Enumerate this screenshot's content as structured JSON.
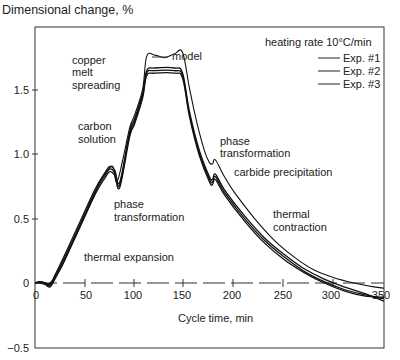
{
  "chart_data": {
    "type": "line",
    "title": "Dimensional change, %",
    "ylabel": "Dimensional change, %",
    "xlabel": "Cycle time, min",
    "xlim": [
      0,
      350
    ],
    "ylim": [
      -0.5,
      1.9
    ],
    "xticks": [
      0,
      50,
      100,
      150,
      200,
      250,
      300,
      350
    ],
    "yticks": [
      -0.5,
      0,
      0.5,
      1.0,
      1.5
    ],
    "xtick_labels": [
      "0",
      "50",
      "100",
      "150",
      "200",
      "250",
      "300",
      "350"
    ],
    "ytick_labels": [
      "−0.5",
      "0",
      "0.5",
      "1.0",
      "1.5"
    ],
    "grid": false,
    "zero_line": "dashed",
    "legend": {
      "title": "heating rate 10°C/min",
      "position": "upper right",
      "entries": [
        "Exp. #1",
        "Exp. #2",
        "Exp. #3"
      ]
    },
    "series": [
      {
        "name": "model",
        "x": [
          0,
          10,
          15,
          25,
          40,
          55,
          65,
          72,
          78,
          82,
          88,
          95,
          100,
          108,
          112,
          120,
          130,
          140,
          148,
          155,
          162,
          170,
          175,
          178,
          181,
          190,
          200,
          220,
          240,
          260,
          280,
          300,
          320,
          340,
          350
        ],
        "y": [
          0,
          0,
          0,
          0.1,
          0.35,
          0.6,
          0.78,
          0.86,
          0.9,
          0.78,
          0.95,
          1.2,
          1.3,
          1.5,
          1.75,
          1.76,
          1.74,
          1.77,
          1.78,
          1.5,
          1.25,
          1.02,
          0.93,
          0.92,
          0.95,
          0.82,
          0.7,
          0.5,
          0.33,
          0.2,
          0.1,
          0.04,
          0.0,
          -0.03,
          -0.04
        ]
      },
      {
        "name": "Exp. #1",
        "x": [
          0,
          5,
          10,
          15,
          20,
          30,
          45,
          60,
          70,
          75,
          80,
          85,
          95,
          100,
          108,
          112,
          120,
          140,
          148,
          155,
          165,
          175,
          178,
          181,
          190,
          210,
          230,
          250,
          270,
          290,
          310,
          330,
          350
        ],
        "y": [
          0,
          0.01,
          0,
          -0.02,
          0.05,
          0.2,
          0.45,
          0.7,
          0.83,
          0.88,
          0.85,
          0.76,
          1.15,
          1.25,
          1.45,
          1.62,
          1.64,
          1.64,
          1.6,
          1.3,
          1.0,
          0.8,
          0.78,
          0.82,
          0.7,
          0.5,
          0.33,
          0.2,
          0.09,
          0.01,
          -0.05,
          -0.09,
          -0.12
        ]
      },
      {
        "name": "Exp. #2",
        "x": [
          0,
          5,
          10,
          15,
          20,
          30,
          45,
          60,
          70,
          75,
          80,
          85,
          95,
          100,
          108,
          112,
          120,
          140,
          148,
          155,
          165,
          175,
          178,
          181,
          190,
          210,
          230,
          250,
          270,
          290,
          310,
          330,
          350
        ],
        "y": [
          0,
          0.01,
          0,
          -0.01,
          0.06,
          0.22,
          0.47,
          0.72,
          0.85,
          0.9,
          0.87,
          0.78,
          1.17,
          1.27,
          1.47,
          1.64,
          1.66,
          1.66,
          1.62,
          1.32,
          1.02,
          0.82,
          0.8,
          0.84,
          0.72,
          0.52,
          0.35,
          0.22,
          0.11,
          0.03,
          -0.03,
          -0.08,
          -0.14
        ]
      },
      {
        "name": "Exp. #3",
        "x": [
          0,
          5,
          10,
          15,
          20,
          30,
          45,
          60,
          70,
          75,
          80,
          85,
          95,
          100,
          108,
          112,
          120,
          140,
          148,
          155,
          165,
          175,
          178,
          181,
          190,
          210,
          230,
          250,
          270,
          290,
          310,
          330,
          350
        ],
        "y": [
          0,
          0.0,
          -0.01,
          -0.03,
          0.03,
          0.18,
          0.43,
          0.68,
          0.81,
          0.86,
          0.83,
          0.74,
          1.13,
          1.23,
          1.43,
          1.6,
          1.62,
          1.62,
          1.58,
          1.28,
          0.98,
          0.78,
          0.76,
          0.8,
          0.68,
          0.48,
          0.31,
          0.18,
          0.08,
          0.0,
          -0.06,
          -0.1,
          -0.11
        ]
      }
    ],
    "annotations": [
      {
        "text": [
          "copper",
          "melt",
          "spreading"
        ],
        "x": 62,
        "y": 1.62
      },
      {
        "text": [
          "carbon",
          "solution"
        ],
        "x": 62,
        "y": 1.1
      },
      {
        "text": [
          "phase",
          "transformation"
        ],
        "x": 90,
        "y": 0.62
      },
      {
        "text": [
          "model"
        ],
        "x": 150,
        "y": 1.78
      },
      {
        "text": [
          "phase",
          "transformation"
        ],
        "x": 185,
        "y": 1.05
      },
      {
        "text": [
          "carbide precipitation"
        ],
        "x": 198,
        "y": 0.86
      },
      {
        "text": [
          "thermal",
          "contraction"
        ],
        "x": 240,
        "y": 0.57
      },
      {
        "text": [
          "thermal expansion"
        ],
        "x": 82,
        "y": 0.2
      }
    ]
  },
  "labels": {
    "title": "Dimensional change, %",
    "xlabel": "Cycle time, min",
    "legend_title": "heating rate 10°C/min",
    "legend_1": "Exp. #1",
    "legend_2": "Exp. #2",
    "legend_3": "Exp. #3",
    "ann_copper_1": "copper",
    "ann_copper_2": "melt",
    "ann_copper_3": "spreading",
    "ann_carbon_1": "carbon",
    "ann_carbon_2": "solution",
    "ann_phase1_1": "phase",
    "ann_phase1_2": "transformation",
    "ann_model": "model",
    "ann_phase2_1": "phase",
    "ann_phase2_2": "transformation",
    "ann_carbide": "carbide precipitation",
    "ann_contraction_1": "thermal",
    "ann_contraction_2": "contraction",
    "ann_expansion": "thermal expansion",
    "ytick_m05": "−0.5",
    "ytick_0": "0",
    "ytick_05": "0.5",
    "ytick_10": "1.0",
    "ytick_15": "1.5",
    "xtick_0": "0",
    "xtick_50": "50",
    "xtick_100": "100",
    "xtick_150": "150",
    "xtick_200": "200",
    "xtick_250": "250",
    "xtick_300": "300",
    "xtick_350": "350"
  }
}
